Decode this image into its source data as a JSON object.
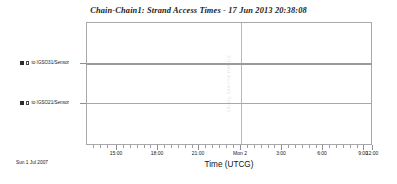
{
  "chart_data": {
    "type": "table",
    "title": "Chain-Chain1:  Strand Access Times - 17 Jun 2013 20:38:08",
    "xlabel": "Time (UTCG)",
    "ylabel": "",
    "grid": "major-vertical-only",
    "legend_position": "y-axis-labels",
    "epoch_label": "Sun 1  Jul 2007",
    "watermark": "Strand Access Times",
    "x_tick_labels": [
      "15:00",
      "18:00",
      "21:00",
      "Mon 2",
      "3:00",
      "6:00",
      "9:00",
      "12:00"
    ],
    "x_tick_positions_px": [
      116,
      157,
      198,
      240,
      281,
      322,
      363,
      372
    ],
    "x_major_gridline_at": "Mon 2",
    "categories": [
      "to IGSO31/Sensor",
      "to IGSO21/Sensor"
    ],
    "series": [
      {
        "name": "to IGSO31/Sensor",
        "row_index": 0,
        "coverage": "continuous across full displayed time span",
        "values": [
          1,
          1
        ]
      },
      {
        "name": "to IGSO21/Sensor",
        "row_index": 1,
        "coverage": "continuous across full displayed time span",
        "values": [
          1,
          1
        ]
      }
    ],
    "colors": {
      "strand_0": "#989a9e",
      "strand_1": "#a6a8ac",
      "frame": "#a8a8ac",
      "gridline": "#b9b9bd",
      "text": "#17171a"
    }
  },
  "axes": {
    "x_title": "Time (UTCG)",
    "ticks": [
      {
        "label": "15:00",
        "x": 116,
        "major": true
      },
      {
        "label": "18:00",
        "x": 157,
        "major": true
      },
      {
        "label": "21:00",
        "x": 198,
        "major": true
      },
      {
        "label": "Mon 2",
        "x": 240,
        "major": true
      },
      {
        "label": "3:00",
        "x": 281,
        "major": true
      },
      {
        "label": "6:00",
        "x": 322,
        "major": true
      },
      {
        "label": "9:00",
        "x": 363,
        "major": true
      },
      {
        "label": "12:00",
        "x": 372,
        "major": true
      }
    ],
    "minor_ticks_x": [
      93,
      100,
      107,
      123,
      130,
      137,
      144,
      150,
      164,
      171,
      178,
      185,
      192,
      205,
      212,
      219,
      226,
      233,
      247,
      254,
      261,
      268,
      274,
      288,
      295,
      302,
      309,
      316,
      329,
      336,
      343,
      350,
      357
    ],
    "rows": [
      {
        "label": "to IGSO31/Sensor",
        "y": 63,
        "swatch_filled": true,
        "swatch_open": true
      },
      {
        "label": "to IGSO21/Sensor",
        "y": 103,
        "swatch_filled": true,
        "swatch_open": true
      }
    ]
  },
  "header": {
    "title": "Chain-Chain1:  Strand Access Times - 17 Jun 2013 20:38:08"
  },
  "footer": {
    "epoch": "Sun 1  Jul 2007"
  },
  "plot": {
    "watermark": "Strand Access Times"
  }
}
